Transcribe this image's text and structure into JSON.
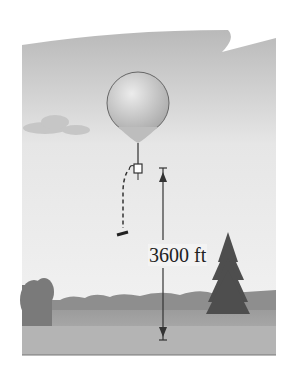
{
  "figure": {
    "height_label": "3600 ft",
    "elements": [
      "sky",
      "cloud",
      "balloon",
      "instrument-package",
      "falling-object-path",
      "height-arrow",
      "pine-tree",
      "bushes",
      "treeline",
      "field"
    ]
  },
  "colors": {
    "sky_top": "#bdbdbd",
    "sky_bottom": "#f2f2f2",
    "balloon": "#cfcfcf",
    "ground": "#a9a9a9",
    "tree": "#555555",
    "text": "#222222"
  }
}
